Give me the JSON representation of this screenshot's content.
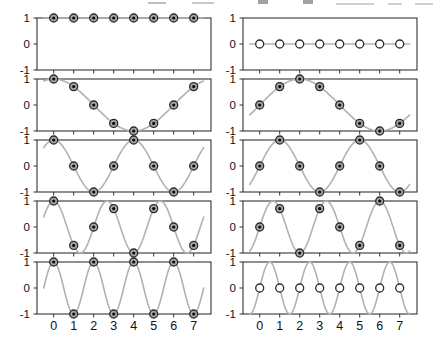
{
  "figure": {
    "x_tick_labels": [
      "0",
      "1",
      "2",
      "3",
      "4",
      "5",
      "6",
      "7"
    ],
    "y_tick_labels": [
      "1",
      "0",
      "-1"
    ],
    "y_tick_values": [
      1,
      0,
      -1
    ],
    "colors": {
      "background": "#ffffff",
      "curve": "#b2b2b2",
      "box": "#333333",
      "tick": "#333333",
      "marker_ring": "#2b2b2b",
      "marker_fill": "#a5a5a5",
      "marker_dot": "#0a0a0a",
      "open_marker_fill": "#ffffff",
      "text": "#111111",
      "cropped_text": "#8a8a8a"
    }
  },
  "chart_data": {
    "type": "line",
    "grid": [
      5,
      2
    ],
    "samples_per_period": 8,
    "x_samples": [
      0,
      1,
      2,
      3,
      4,
      5,
      6,
      7
    ],
    "xlim": [
      -0.85,
      7.85
    ],
    "ylim": [
      -1,
      1
    ],
    "curve_range": [
      -0.5,
      7.5
    ],
    "panels": [
      {
        "row": 0,
        "col": 0,
        "wave": "cos",
        "k": 0,
        "marker": "bullseye",
        "y_samples": [
          1,
          1,
          1,
          1,
          1,
          1,
          1,
          1
        ]
      },
      {
        "row": 0,
        "col": 1,
        "wave": "sin",
        "k": 0,
        "marker": "open",
        "y_samples": [
          0,
          0,
          0,
          0,
          0,
          0,
          0,
          0
        ]
      },
      {
        "row": 1,
        "col": 0,
        "wave": "cos",
        "k": 1,
        "marker": "bullseye",
        "y_samples": [
          1,
          0.707,
          0,
          -0.707,
          -1,
          -0.707,
          0,
          0.707
        ]
      },
      {
        "row": 1,
        "col": 1,
        "wave": "sin",
        "k": 1,
        "marker": "bullseye",
        "y_samples": [
          0,
          0.707,
          1,
          0.707,
          0,
          -0.707,
          -1,
          -0.707
        ]
      },
      {
        "row": 2,
        "col": 0,
        "wave": "cos",
        "k": 2,
        "marker": "bullseye",
        "y_samples": [
          1,
          0,
          -1,
          0,
          1,
          0,
          -1,
          0
        ]
      },
      {
        "row": 2,
        "col": 1,
        "wave": "sin",
        "k": 2,
        "marker": "bullseye",
        "y_samples": [
          0,
          1,
          0,
          -1,
          0,
          1,
          0,
          -1
        ]
      },
      {
        "row": 3,
        "col": 0,
        "wave": "cos",
        "k": 3,
        "marker": "bullseye",
        "y_samples": [
          1,
          -0.707,
          0,
          0.707,
          -1,
          0.707,
          0,
          -0.707
        ]
      },
      {
        "row": 3,
        "col": 1,
        "wave": "sin",
        "k": 3,
        "marker": "bullseye",
        "y_samples": [
          0,
          0.707,
          -1,
          0.707,
          0,
          -0.707,
          1,
          -0.707
        ]
      },
      {
        "row": 4,
        "col": 0,
        "wave": "cos",
        "k": 4,
        "marker": "bullseye",
        "y_samples": [
          1,
          -1,
          1,
          -1,
          1,
          -1,
          1,
          -1
        ]
      },
      {
        "row": 4,
        "col": 1,
        "wave": "sin",
        "k": 4,
        "marker": "open",
        "y_samples": [
          0,
          0,
          0,
          0,
          0,
          0,
          0,
          0
        ]
      }
    ]
  }
}
